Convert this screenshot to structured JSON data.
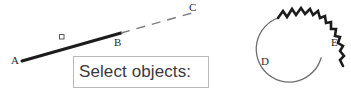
{
  "canvas": {
    "background_color": "#ffffff",
    "width": 351,
    "height": 94
  },
  "prompt": {
    "text": "Select objects:",
    "border_color": "#b9b9b9",
    "background_color": "#ffffff",
    "text_color": "#3a3a3a"
  },
  "labels": {
    "a": "A",
    "b": "B",
    "c": "C",
    "d": "D",
    "e": "E"
  },
  "geometry": {
    "selected_segment": {
      "name": "segment-ab",
      "from": "A",
      "to": "B",
      "style": "solid-thick",
      "color": "#1c1c1c",
      "width": 3
    },
    "unselected_segment": {
      "name": "segment-bc",
      "from": "B",
      "to": "C",
      "style": "dashed",
      "color": "#7d7d7d",
      "width": 1.4
    },
    "grip": {
      "name": "grip-square",
      "shape": "square",
      "fill": "#ffffff",
      "stroke": "#5a5a5a",
      "size": 4
    },
    "circle_selected_arc": {
      "name": "arc-de-zigzag",
      "from": "D",
      "to": "E",
      "style": "zigzag-thick",
      "color": "#1c1c1c",
      "width": 2.6
    },
    "circle_plain_arc": {
      "name": "arc-ed-smooth",
      "from": "E",
      "to": "D",
      "style": "solid-thin",
      "color": "#6e6e6e",
      "width": 1.3
    }
  }
}
